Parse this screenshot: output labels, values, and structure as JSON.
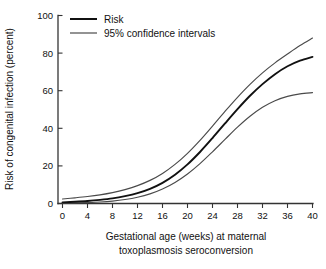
{
  "chart_data": {
    "type": "line",
    "title": "",
    "subtitle": "",
    "xlabel": "Gestational age (weeks) at maternal toxoplasmosis seroconversion",
    "xlabel_line1": "Gestational age (weeks) at maternal",
    "xlabel_line2": "toxoplasmosis seroconversion",
    "ylabel": "Risk of congenital infection (percent)",
    "xlim": [
      0,
      40
    ],
    "ylim": [
      0,
      100
    ],
    "xticks": [
      0,
      4,
      8,
      12,
      16,
      20,
      24,
      28,
      32,
      36,
      40
    ],
    "xtick_labels": [
      "0",
      "4",
      "8",
      "12",
      "16",
      "20",
      "24",
      "28",
      "32",
      "36",
      "40"
    ],
    "yticks": [
      0,
      20,
      40,
      60,
      80,
      100
    ],
    "ytick_labels": [
      "0",
      "20",
      "40",
      "60",
      "80",
      "100"
    ],
    "grid": false,
    "legend_position": "top-left",
    "x": [
      0,
      2,
      4,
      6,
      8,
      10,
      12,
      14,
      16,
      18,
      20,
      22,
      24,
      26,
      28,
      30,
      32,
      34,
      36,
      38,
      40
    ],
    "series": [
      {
        "name": "Risk",
        "style": "solid-bold",
        "color": "#111111",
        "values": [
          0.6,
          0.9,
          1.3,
          1.9,
          2.7,
          3.9,
          5.5,
          7.8,
          11.0,
          15.3,
          20.8,
          27.4,
          34.8,
          42.6,
          50.2,
          57.3,
          63.5,
          68.8,
          73.0,
          76.0,
          78.0
        ]
      },
      {
        "name": "Upper 95% confidence interval",
        "style": "solid-thin",
        "color": "#4a4a4a",
        "values": [
          2.4,
          3.0,
          3.7,
          4.6,
          5.8,
          7.4,
          9.5,
          12.3,
          16.0,
          20.8,
          26.7,
          33.6,
          41.2,
          49.0,
          56.5,
          63.4,
          69.5,
          74.8,
          79.5,
          84.0,
          88.0
        ]
      },
      {
        "name": "Lower 95% confidence interval",
        "style": "solid-thin",
        "color": "#4a4a4a",
        "values": [
          0.2,
          0.3,
          0.5,
          0.8,
          1.3,
          2.1,
          3.3,
          5.1,
          7.7,
          11.2,
          15.7,
          21.2,
          27.5,
          34.1,
          40.6,
          46.4,
          51.2,
          54.7,
          57.0,
          58.3,
          59.0
        ]
      }
    ],
    "legend": [
      {
        "label": "Risk",
        "swatch": "risk-line-swatch"
      },
      {
        "label": "95% confidence intervals",
        "swatch": "ci-line-swatch"
      }
    ],
    "annotations": []
  }
}
